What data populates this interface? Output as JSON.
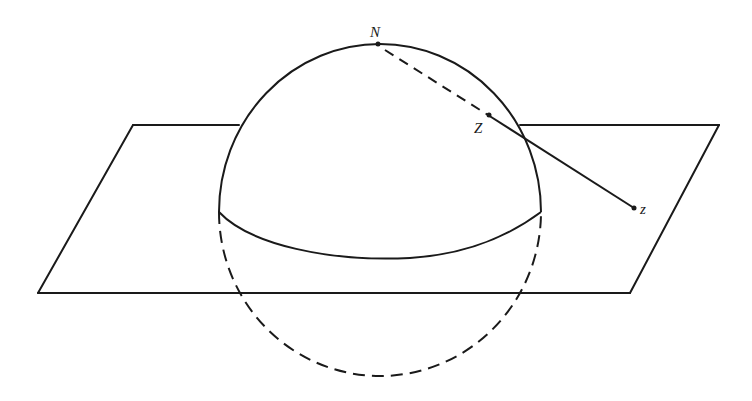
{
  "figure": {
    "labels": {
      "north_pole": "N",
      "sphere_point": "Z",
      "plane_point": "z"
    },
    "colors": {
      "ink": "#1a1a1a",
      "background": "#ffffff"
    }
  }
}
